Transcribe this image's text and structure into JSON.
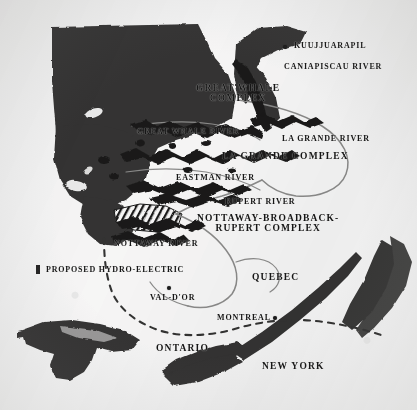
{
  "map": {
    "title": "Proposed Hydro-Electric Complexes of Northern Quebec",
    "background_color": "#f2f1ee",
    "ink_color": "#1b1a18",
    "water_fill_color": "#3a3531",
    "river_line_color": "#8a8680"
  },
  "complexes": [
    {
      "id": "great-whale",
      "line1": "GREAT WHALE",
      "line2": "COMPLEX",
      "x": 196,
      "y": 88
    },
    {
      "id": "la-grande",
      "line1": "LA GRANDE COMPLEX",
      "line2": "",
      "x": 222,
      "y": 155
    },
    {
      "id": "nottaway-broadback-rupert",
      "line1": "NOTTAWAY-BROADBACK-",
      "line2": "RUPERT COMPLEX",
      "x": 197,
      "y": 218
    }
  ],
  "rivers": [
    {
      "id": "caniapiscau-river",
      "label": "CANIAPISCAU RIVER",
      "x": 284,
      "y": 66
    },
    {
      "id": "great-whale-river",
      "label": "GREAT WHALE RIVER",
      "x": 137,
      "y": 131
    },
    {
      "id": "la-grande-river",
      "label": "LA GRANDE RIVER",
      "x": 282,
      "y": 138
    },
    {
      "id": "eastman-river",
      "label": "EASTMAN RIVER",
      "x": 176,
      "y": 177
    },
    {
      "id": "rupert-river",
      "label": "RUPERT RIVER",
      "x": 225,
      "y": 201
    },
    {
      "id": "nottaway-river",
      "label": "NOTTAWAY RIVER",
      "x": 114,
      "y": 242
    }
  ],
  "regions": [
    {
      "id": "quebec",
      "label": "QUEBEC",
      "x": 252,
      "y": 277
    },
    {
      "id": "ontario",
      "label": "ONTARIO",
      "x": 156,
      "y": 348
    },
    {
      "id": "new-york",
      "label": "NEW YORK",
      "x": 262,
      "y": 366
    }
  ],
  "cities": [
    {
      "id": "kuujjuarapil",
      "label": "KUUJJUARAPIL",
      "label_x": 294,
      "label_y": 46,
      "dot_x": 285,
      "dot_y": 48
    },
    {
      "id": "val-dor",
      "label": "VAL-D'OR",
      "label_x": 150,
      "label_y": 298,
      "dot_x": 169,
      "dot_y": 288
    },
    {
      "id": "montreal",
      "label": "MONTREAL",
      "label_x": 217,
      "label_y": 318,
      "dot_x": 275,
      "dot_y": 318
    }
  ],
  "legend": {
    "id": "proposed-hydro-electric",
    "label": "PROPOSED HYDRO-ELECTRIC",
    "swatch_x": 36,
    "swatch_y": 265,
    "label_x": 46,
    "label_y": 266,
    "swatch_color": "#2a2623"
  }
}
